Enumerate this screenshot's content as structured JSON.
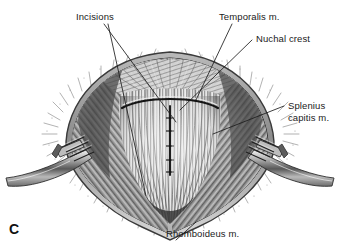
{
  "figure": {
    "panel_letter": "C",
    "background_color": "#ffffff",
    "ink_color": "#1a1a1a",
    "media": "grayscale pen-and-ink surgical anatomy illustration"
  },
  "annotations": [
    {
      "id": "incisions",
      "label": "Incisions",
      "x": 76,
      "y": 11,
      "leaders": 2,
      "target_description": "transverse curved incision at nuchal crest and midline vertical incision"
    },
    {
      "id": "temporalis",
      "label": "Temporalis m.",
      "x": 219,
      "y": 11,
      "leaders": 1,
      "target_description": "fan-shaped muscle at upper right of surgical field"
    },
    {
      "id": "nuchal-crest",
      "label": "Nuchal crest",
      "x": 256,
      "y": 33,
      "leaders": 1,
      "target_description": "transverse bony ridge beneath converging aponeurosis"
    },
    {
      "id": "splenius-capitis",
      "label": "Splenius\ncapitis m.",
      "line1": "Splenius",
      "line2": "capitis m.",
      "x": 288,
      "y": 100,
      "leaders": 1,
      "target_description": "broad muscle belly right of midline"
    },
    {
      "id": "rhomboideus",
      "label": "Rhomboideus m.",
      "x": 166,
      "y": 228,
      "leaders": 1,
      "target_description": "deep muscle at caudal apex of the wound"
    }
  ],
  "instruments": [
    {
      "id": "retractor-left",
      "name": "rake retractor",
      "side": "left",
      "prongs": 4
    },
    {
      "id": "retractor-right",
      "name": "rake retractor",
      "side": "right",
      "prongs": 4
    }
  ]
}
